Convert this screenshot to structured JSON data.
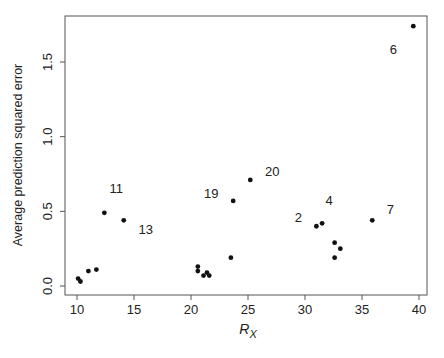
{
  "chart_data": {
    "type": "scatter",
    "title": "",
    "xlabel": "R",
    "xlabel_subscript": "X",
    "ylabel": "Average prediction squared error",
    "xlim": [
      9,
      41
    ],
    "ylim": [
      -0.05,
      1.82
    ],
    "xticks": [
      10,
      15,
      20,
      25,
      30,
      35,
      40
    ],
    "xtick_labels": [
      "10",
      "15",
      "20",
      "25",
      "30",
      "35",
      "40"
    ],
    "yticks": [
      0.0,
      0.5,
      1.0,
      1.5
    ],
    "ytick_labels": [
      "0.0",
      "0.5",
      "1.0",
      "1.5"
    ],
    "grid": false,
    "legend": null,
    "point_color": "#111111",
    "points": [
      {
        "x": 10.1,
        "y": 0.05,
        "label": ""
      },
      {
        "x": 10.3,
        "y": 0.03,
        "label": ""
      },
      {
        "x": 11.0,
        "y": 0.1,
        "label": ""
      },
      {
        "x": 11.7,
        "y": 0.11,
        "label": ""
      },
      {
        "x": 12.4,
        "y": 0.49,
        "label": "11"
      },
      {
        "x": 14.1,
        "y": 0.44,
        "label": "13"
      },
      {
        "x": 20.6,
        "y": 0.13,
        "label": ""
      },
      {
        "x": 20.6,
        "y": 0.1,
        "label": ""
      },
      {
        "x": 21.1,
        "y": 0.07,
        "label": ""
      },
      {
        "x": 21.4,
        "y": 0.09,
        "label": ""
      },
      {
        "x": 21.6,
        "y": 0.07,
        "label": ""
      },
      {
        "x": 23.5,
        "y": 0.19,
        "label": ""
      },
      {
        "x": 23.7,
        "y": 0.57,
        "label": "19"
      },
      {
        "x": 25.2,
        "y": 0.71,
        "label": "20"
      },
      {
        "x": 31.0,
        "y": 0.4,
        "label": "2"
      },
      {
        "x": 31.5,
        "y": 0.42,
        "label": "4"
      },
      {
        "x": 32.6,
        "y": 0.29,
        "label": ""
      },
      {
        "x": 33.1,
        "y": 0.25,
        "label": ""
      },
      {
        "x": 32.6,
        "y": 0.19,
        "label": ""
      },
      {
        "x": 35.9,
        "y": 0.44,
        "label": "7"
      },
      {
        "x": 39.5,
        "y": 1.74,
        "label": "6"
      }
    ],
    "annotations": [
      {
        "text": "11",
        "x": 12.4,
        "y": 0.49,
        "dx": 12,
        "dy": -20
      },
      {
        "text": "13",
        "x": 14.1,
        "y": 0.44,
        "dx": 22,
        "dy": 14
      },
      {
        "text": "19",
        "x": 23.7,
        "y": 0.57,
        "dx": -22,
        "dy": -3
      },
      {
        "text": "20",
        "x": 25.2,
        "y": 0.71,
        "dx": 22,
        "dy": -4
      },
      {
        "text": "2",
        "x": 31.0,
        "y": 0.4,
        "dx": -18,
        "dy": -4
      },
      {
        "text": "4",
        "x": 31.5,
        "y": 0.42,
        "dx": 7,
        "dy": -18
      },
      {
        "text": "7",
        "x": 35.9,
        "y": 0.44,
        "dx": 18,
        "dy": -6
      },
      {
        "text": "6",
        "x": 39.5,
        "y": 1.74,
        "dx": -20,
        "dy": 28
      }
    ]
  }
}
